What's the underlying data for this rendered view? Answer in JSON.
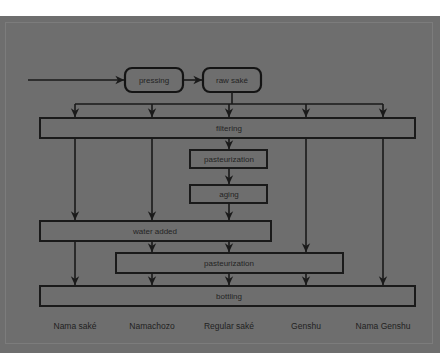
{
  "meta": {
    "background_color": "#6e6e6e",
    "ink_color": "#1a1a1a",
    "paper_color": "#ffffff"
  },
  "diagram": {
    "type": "flowchart",
    "orientation": "top-to-bottom",
    "start_edge_label": "",
    "nodes": {
      "pressing": {
        "label": "pressing",
        "shape": "rounded-rect",
        "x": 125,
        "y": 68,
        "w": 58,
        "h": 24
      },
      "raw_sake": {
        "label": "raw saké",
        "shape": "rounded-rect",
        "x": 203,
        "y": 68,
        "w": 58,
        "h": 24
      },
      "filtering": {
        "label": "filtering",
        "shape": "wide-bar",
        "x": 40,
        "y": 118,
        "w": 375,
        "h": 20
      },
      "pasteurization_1": {
        "label": "pasteurization",
        "shape": "rect",
        "x": 190,
        "y": 150,
        "w": 77,
        "h": 18
      },
      "aging": {
        "label": "aging",
        "shape": "rect",
        "x": 190,
        "y": 185,
        "w": 77,
        "h": 18
      },
      "water_added": {
        "label": "water added",
        "shape": "wide-bar",
        "x": 40,
        "y": 221,
        "w": 231,
        "h": 20
      },
      "pasteurization_2": {
        "label": "pasteurization",
        "shape": "wide-bar",
        "x": 116,
        "y": 253,
        "w": 227,
        "h": 20
      },
      "bottling": {
        "label": "bottling",
        "shape": "wide-bar",
        "x": 40,
        "y": 286,
        "w": 375,
        "h": 20
      }
    },
    "branch_columns": [
      {
        "key": "nama-sake",
        "x": 75,
        "label": "Nama saké"
      },
      {
        "key": "namachozo",
        "x": 152,
        "label": "Namachozo"
      },
      {
        "key": "regular-sake",
        "x": 229,
        "label": "Regular saké"
      },
      {
        "key": "genshu",
        "x": 306,
        "label": "Genshu"
      },
      {
        "key": "nama-genshu",
        "x": 383,
        "label": "Nama Genshu"
      }
    ],
    "outputs": [
      {
        "label": "Nama saké",
        "x": 75,
        "y": 327
      },
      {
        "label": "Namachozo",
        "x": 152,
        "y": 327
      },
      {
        "label": "Regular saké",
        "x": 229,
        "y": 327
      },
      {
        "label": "Genshu",
        "x": 306,
        "y": 327
      },
      {
        "label": "Nama Genshu",
        "x": 383,
        "y": 327
      }
    ],
    "flow_steps": [
      "pressing",
      "raw saké",
      "filtering",
      "pasteurization",
      "aging",
      "water added",
      "pasteurization",
      "bottling"
    ]
  }
}
